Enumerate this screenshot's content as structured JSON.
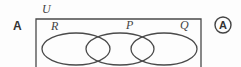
{
  "diagram": {
    "type": "venn",
    "question_label": "A",
    "universal_set_label": "U",
    "sets": [
      {
        "label": "R"
      },
      {
        "label": "P"
      },
      {
        "label": "Q"
      }
    ],
    "answer_option": "A",
    "stroke_color": "#4a4a4a"
  }
}
